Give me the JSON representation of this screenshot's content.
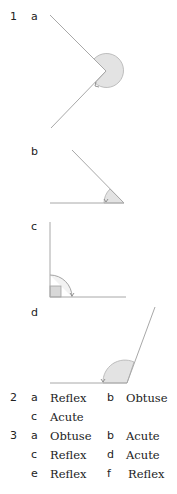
{
  "exercise_1": {
    "number": "1",
    "parts": [
      {
        "label": "a",
        "angle_type": "reflex"
      },
      {
        "label": "b",
        "angle_type": "acute"
      },
      {
        "label": "c",
        "angle_type": "right"
      },
      {
        "label": "d",
        "angle_type": "obtuse"
      }
    ]
  },
  "exercise_2": {
    "number": "2",
    "answers": [
      {
        "label": "a",
        "value": "Reflex"
      },
      {
        "label": "b",
        "value": "Obtuse"
      },
      {
        "label": "c",
        "value": "Acute"
      }
    ]
  },
  "exercise_3": {
    "number": "3",
    "answers": [
      {
        "label": "a",
        "value": "Obtuse"
      },
      {
        "label": "b",
        "value": "Acute"
      },
      {
        "label": "c",
        "value": "Reflex"
      },
      {
        "label": "d",
        "value": "Acute"
      },
      {
        "label": "e",
        "value": "Reflex"
      },
      {
        "label": "f",
        "value": "Reflex"
      }
    ]
  },
  "colors": {
    "line": "#a8a8a8",
    "fill": "#e3e3e3",
    "arc": "#9a9a9a",
    "text": "#222222"
  }
}
